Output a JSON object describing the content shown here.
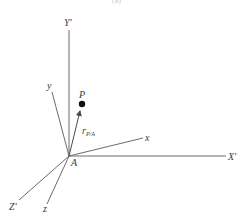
{
  "figure": {
    "top_partial_text": "(a)",
    "labels": {
      "Y_prime": "Y'",
      "X_prime": "X'",
      "Z_prime": "Z'",
      "x": "x",
      "y": "y",
      "z": "z",
      "origin": "A",
      "point": "P",
      "position_vector_main": "r",
      "position_vector_sub": "P/A"
    },
    "colors": {
      "line": "#6b6b6b",
      "text": "#3a3a3a",
      "point": "#111111",
      "background": "#ffffff"
    }
  }
}
